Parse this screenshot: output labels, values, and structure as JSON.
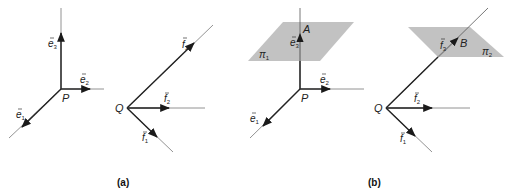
{
  "figure": {
    "panel_a": {
      "caption": "(a)",
      "origin_P": "P",
      "origin_Q": "Q",
      "vectors_P": [
        {
          "name": "e",
          "sub": "1"
        },
        {
          "name": "e",
          "sub": "2"
        },
        {
          "name": "e",
          "sub": "3"
        }
      ],
      "vectors_Q": [
        {
          "name": "f",
          "sub": "1"
        },
        {
          "name": "f",
          "sub": "2"
        },
        {
          "name": "f",
          "sub": "3"
        }
      ]
    },
    "panel_b": {
      "caption": "(b)",
      "origin_P": "P",
      "origin_Q": "Q",
      "point_A": "A",
      "point_B": "B",
      "plane_1": {
        "name": "π",
        "sub": "1"
      },
      "plane_2": {
        "name": "π",
        "sub": "2"
      },
      "vectors_P": [
        {
          "name": "e",
          "sub": "1"
        },
        {
          "name": "e",
          "sub": "2"
        },
        {
          "name": "e",
          "sub": "3"
        }
      ],
      "vectors_Q": [
        {
          "name": "f",
          "sub": "1"
        },
        {
          "name": "f",
          "sub": "2"
        },
        {
          "name": "f",
          "sub": "3"
        }
      ]
    },
    "colors": {
      "line": "#2a2a2a",
      "plane": "#bdbdbd"
    }
  }
}
